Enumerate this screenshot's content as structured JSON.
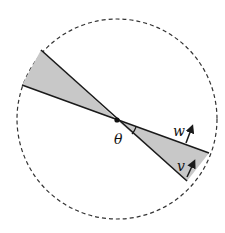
{
  "diagram": {
    "labels": {
      "theta": "θ",
      "w": "w",
      "v": "v"
    },
    "colors": {
      "wedge_fill": "#c8c8c8",
      "line": "#1a1a1a",
      "circle_dash": "#333333",
      "background": "#ffffff"
    },
    "geometry": {
      "circle": {
        "cx": 117,
        "cy": 119,
        "r": 100
      },
      "center_point": {
        "x": 117,
        "y": 120
      },
      "wedge_upper_left": [
        [
          117,
          120
        ],
        [
          41,
          50
        ],
        [
          22,
          85
        ]
      ],
      "wedge_lower_right": [
        [
          117,
          120
        ],
        [
          209,
          153
        ],
        [
          187,
          181
        ]
      ],
      "arrow_w": {
        "from": [
          186,
          143
        ],
        "to": [
          193,
          125
        ]
      },
      "arrow_v": {
        "from": [
          187,
          177
        ],
        "to": [
          195,
          160
        ]
      }
    }
  }
}
